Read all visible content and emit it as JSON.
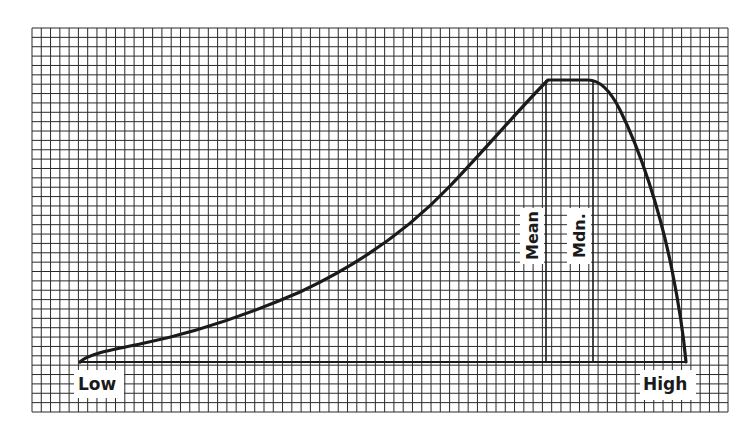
{
  "chart_data": {
    "type": "line",
    "title": "",
    "xlabel": "",
    "ylabel": "",
    "x_labels": {
      "left": "Low",
      "right": "High"
    },
    "annotations": [
      {
        "label": "Mean",
        "x_rel": 0.785,
        "orientation": "vertical"
      },
      {
        "label": "Mdn.",
        "x_rel": 0.85,
        "orientation": "vertical"
      }
    ],
    "grid": true,
    "curve_points_rel": [
      [
        0.0,
        0.0
      ],
      [
        0.05,
        0.05
      ],
      [
        0.15,
        0.12
      ],
      [
        0.25,
        0.21
      ],
      [
        0.35,
        0.33
      ],
      [
        0.45,
        0.48
      ],
      [
        0.55,
        0.66
      ],
      [
        0.65,
        0.84
      ],
      [
        0.72,
        0.95
      ],
      [
        0.78,
        1.0
      ],
      [
        0.85,
        1.0
      ],
      [
        0.88,
        0.96
      ],
      [
        0.92,
        0.8
      ],
      [
        0.96,
        0.5
      ],
      [
        1.0,
        0.0
      ]
    ]
  },
  "labels": {
    "low": "Low",
    "high": "High",
    "mean": "Mean",
    "median": "Mdn."
  },
  "colors": {
    "grid": "#2a2a2a",
    "curve": "#1a1a1a",
    "background": "#ffffff"
  }
}
